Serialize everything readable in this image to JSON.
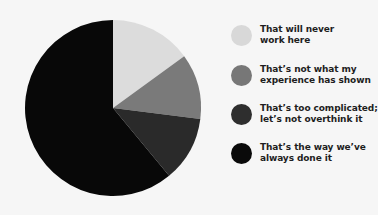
{
  "chart_data": {
    "type": "pie",
    "title": "",
    "start_angle_deg": 0,
    "direction": "clockwise",
    "legend_position": "right",
    "slices": [
      {
        "label": "That will never work here",
        "lines": [
          "That will never",
          "work here"
        ],
        "value": 15,
        "color": "#dcdcdc"
      },
      {
        "label": "That's not what my experience has shown",
        "lines": [
          "That’s not what my",
          "experience has shown"
        ],
        "value": 12,
        "color": "#7a7a7a"
      },
      {
        "label": "That's too complicated; let's not overthink it",
        "lines": [
          "That’s too complicated;",
          "let’s not overthink it"
        ],
        "value": 12,
        "color": "#2a2a2a"
      },
      {
        "label": "That's the way we've always done it",
        "lines": [
          "That’s the way we’ve",
          "always done it"
        ],
        "value": 61,
        "color": "#080808"
      }
    ]
  },
  "legend": {
    "items": [
      {
        "line1": "That will never",
        "line2": "work here",
        "color": "#d8d8d8"
      },
      {
        "line1": "That’s not what my",
        "line2": "experience has shown",
        "color": "#777777"
      },
      {
        "line1": "That’s too complicated;",
        "line2": "let’s not overthink it",
        "color": "#2e2e2e"
      },
      {
        "line1": "That’s the way we’ve",
        "line2": "always done it",
        "color": "#0a0a0a"
      }
    ]
  },
  "layout": {
    "pie_center": [
      113,
      108
    ],
    "pie_radius": 88
  }
}
